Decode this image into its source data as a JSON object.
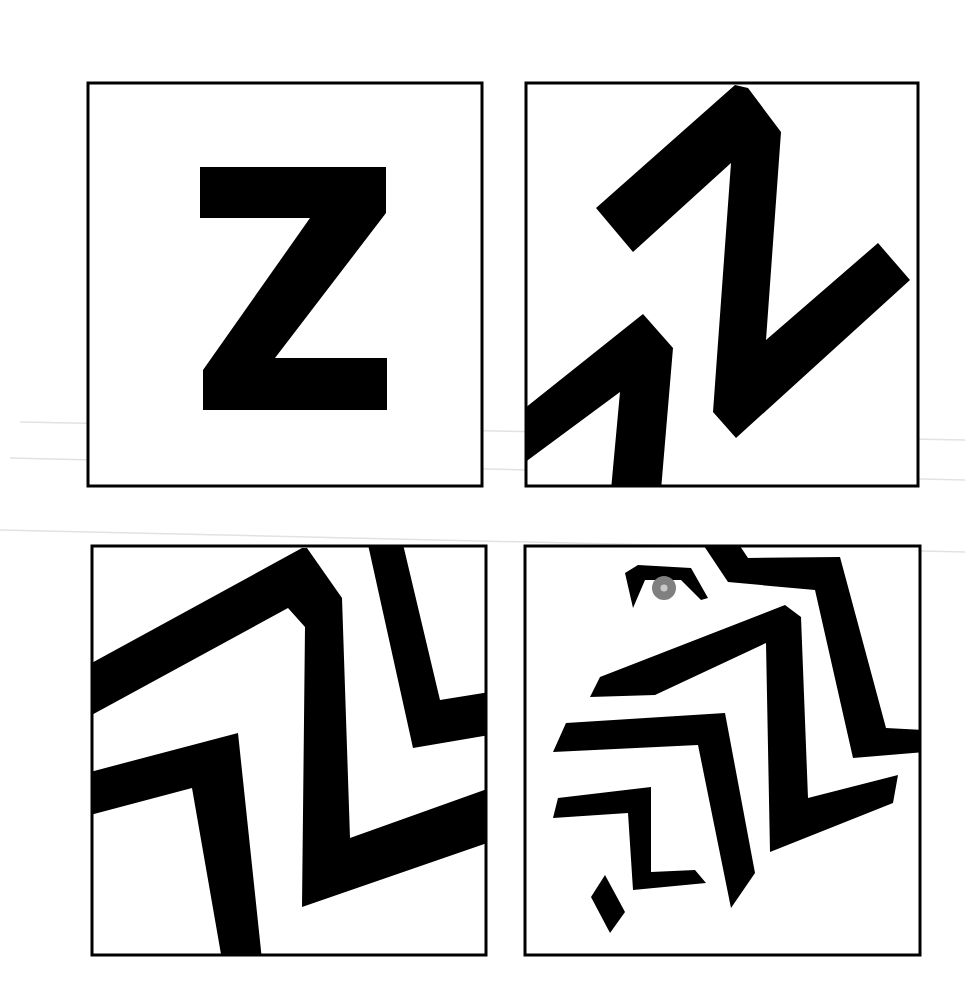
{
  "figure": {
    "description": "Four-panel sequence showing the letter Z progressively transforming into an abstract bird/eagle head with an eye",
    "colors": {
      "ink": "#000000",
      "paper": "#ffffff",
      "iris": "#808080",
      "pupil_highlight": "#c8c8c8",
      "scan_line": "#e2e2e2"
    },
    "panels": [
      {
        "id": 1,
        "label": "Letter Z",
        "position": "top-left"
      },
      {
        "id": 2,
        "label": "Z distorted into zigzag",
        "position": "top-right"
      },
      {
        "id": 3,
        "label": "Overlapping zigzag bands",
        "position": "bottom-left"
      },
      {
        "id": 4,
        "label": "Zigzags forming bird head with eye",
        "position": "bottom-right"
      }
    ]
  }
}
